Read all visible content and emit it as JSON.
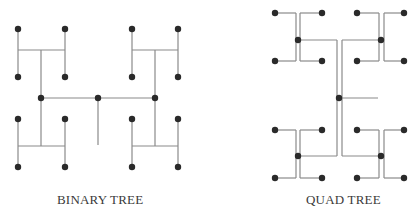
{
  "diagrams": [
    {
      "id": "binary",
      "label": "BINARY TREE",
      "label_pos": {
        "x": 57,
        "y": 192
      },
      "edges": [
        [
          18,
          29,
          18,
          77
        ],
        [
          65,
          29,
          65,
          77
        ],
        [
          18,
          50,
          65,
          50
        ],
        [
          132,
          29,
          132,
          77
        ],
        [
          178,
          29,
          178,
          77
        ],
        [
          132,
          50,
          178,
          50
        ],
        [
          18,
          119,
          18,
          167
        ],
        [
          65,
          119,
          65,
          167
        ],
        [
          18,
          146,
          65,
          146
        ],
        [
          132,
          119,
          132,
          167
        ],
        [
          178,
          119,
          178,
          167
        ],
        [
          132,
          146,
          178,
          146
        ],
        [
          41,
          50,
          41,
          146
        ],
        [
          155,
          50,
          155,
          146
        ],
        [
          41,
          98,
          155,
          98
        ],
        [
          98,
          98,
          98,
          145
        ]
      ],
      "nodes": [
        [
          18,
          29
        ],
        [
          65,
          29
        ],
        [
          18,
          77
        ],
        [
          65,
          77
        ],
        [
          132,
          29
        ],
        [
          178,
          29
        ],
        [
          132,
          77
        ],
        [
          178,
          77
        ],
        [
          18,
          119
        ],
        [
          65,
          119
        ],
        [
          18,
          167
        ],
        [
          65,
          167
        ],
        [
          132,
          119
        ],
        [
          178,
          119
        ],
        [
          132,
          167
        ],
        [
          178,
          167
        ],
        [
          41,
          98
        ],
        [
          98,
          98
        ],
        [
          155,
          98
        ]
      ]
    },
    {
      "id": "quad",
      "label": "QUAD TREE",
      "label_pos": {
        "x": 306,
        "y": 192
      },
      "edges": [
        [
          275,
          13,
          296,
          13
        ],
        [
          296,
          13,
          296,
          61
        ],
        [
          296,
          61,
          275,
          61
        ],
        [
          322,
          13,
          300,
          13
        ],
        [
          300,
          13,
          300,
          61
        ],
        [
          300,
          61,
          322,
          61
        ],
        [
          298,
          40,
          337,
          40
        ],
        [
          357,
          13,
          379,
          13
        ],
        [
          379,
          13,
          379,
          61
        ],
        [
          379,
          61,
          357,
          61
        ],
        [
          404,
          13,
          384,
          13
        ],
        [
          384,
          13,
          384,
          61
        ],
        [
          384,
          61,
          404,
          61
        ],
        [
          342,
          40,
          381,
          40
        ],
        [
          275,
          130,
          296,
          130
        ],
        [
          296,
          130,
          296,
          178
        ],
        [
          296,
          178,
          275,
          178
        ],
        [
          322,
          130,
          300,
          130
        ],
        [
          300,
          130,
          300,
          178
        ],
        [
          300,
          178,
          322,
          178
        ],
        [
          298,
          156,
          337,
          156
        ],
        [
          357,
          130,
          379,
          130
        ],
        [
          379,
          130,
          379,
          178
        ],
        [
          379,
          178,
          357,
          178
        ],
        [
          404,
          130,
          384,
          130
        ],
        [
          384,
          130,
          384,
          178
        ],
        [
          384,
          178,
          404,
          178
        ],
        [
          342,
          156,
          381,
          156
        ],
        [
          337,
          40,
          337,
          156
        ],
        [
          342,
          40,
          342,
          156
        ],
        [
          339,
          98,
          378,
          98
        ]
      ],
      "nodes": [
        [
          275,
          13
        ],
        [
          322,
          13
        ],
        [
          275,
          61
        ],
        [
          322,
          61
        ],
        [
          298,
          40
        ],
        [
          357,
          13
        ],
        [
          404,
          13
        ],
        [
          357,
          61
        ],
        [
          404,
          61
        ],
        [
          381,
          40
        ],
        [
          275,
          130
        ],
        [
          322,
          130
        ],
        [
          275,
          178
        ],
        [
          322,
          178
        ],
        [
          298,
          156
        ],
        [
          357,
          130
        ],
        [
          404,
          130
        ],
        [
          357,
          178
        ],
        [
          404,
          178
        ],
        [
          381,
          156
        ],
        [
          339,
          98
        ]
      ]
    }
  ],
  "colors": {
    "edge": "#8a8a8a",
    "node": "#2a2a2a",
    "text": "#3a3a3a"
  },
  "node_radius": 3.2
}
